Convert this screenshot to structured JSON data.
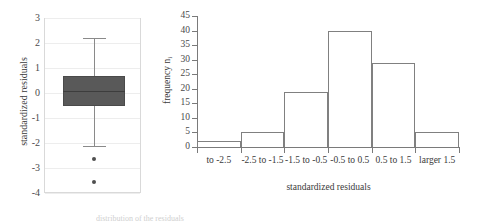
{
  "figure": {
    "caption": "distribution of the residuals"
  },
  "chart_data": [
    {
      "type": "box",
      "title": "",
      "xlabel": "",
      "ylabel": "standardized residuals",
      "ylim": [
        -4,
        3
      ],
      "yticks": [
        3,
        2,
        1,
        0,
        -1,
        -2,
        -3,
        -4
      ],
      "grid": true,
      "legend": "none",
      "boxes": [
        {
          "name": "standardized residuals",
          "whisker_low": -2.1,
          "q1": -0.5,
          "median": 0.1,
          "q3": 0.7,
          "whisker_high": 2.2,
          "outliers": [
            -2.65,
            -3.55
          ],
          "fill_color": "#595959",
          "line_color": "#8a8a8a"
        }
      ]
    },
    {
      "type": "bar",
      "title": "",
      "xlabel": "standardized residuals",
      "ylabel": "frequency n",
      "ylabel_sub": "i",
      "categories": [
        "to -2.5",
        "-2.5 to -1.5",
        "-1.5 to -0.5",
        "-0.5 to 0.5",
        "0.5 to 1.5",
        "larger 1.5"
      ],
      "values": [
        2,
        5,
        19,
        40,
        29,
        5
      ],
      "ylim": [
        0,
        45
      ],
      "yticks": [
        45,
        40,
        35,
        30,
        25,
        20,
        15,
        10,
        5,
        0
      ],
      "grid": false,
      "legend": "none",
      "bar_fill": "#ffffff",
      "bar_stroke": "#808080"
    }
  ]
}
